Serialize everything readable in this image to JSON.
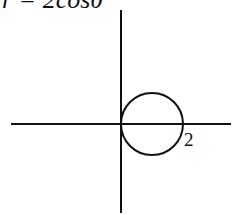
{
  "title": "r = 2cosθ",
  "axes": {
    "x_axis": {
      "x1": 11,
      "x2": 231,
      "y": 124
    },
    "y_axis": {
      "x": 121,
      "y1": 10,
      "y2": 213
    }
  },
  "curve": {
    "type": "circle",
    "equation": "r = 2cosθ",
    "center_px": [
      152,
      124
    ],
    "radius_px": 31,
    "stroke": "#111111"
  },
  "labels": {
    "intercept": "2"
  },
  "colors": {
    "ink": "#111111",
    "background": "#ffffff"
  }
}
